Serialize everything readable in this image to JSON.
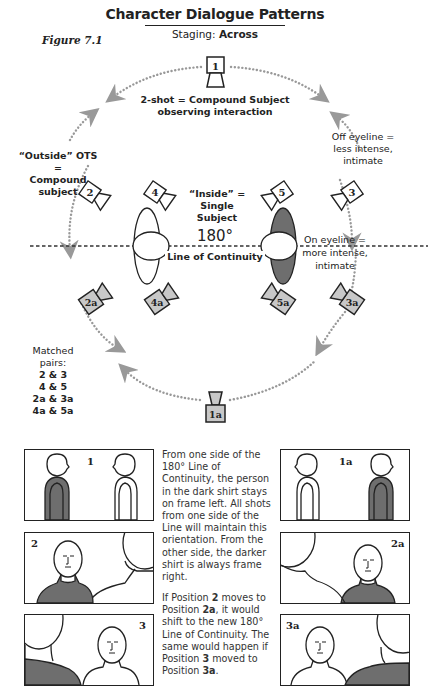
{
  "header": {
    "title": "Character Dialogue Patterns",
    "staging_label": "Staging:",
    "staging_value": "Across",
    "figure_label": "Figure 7.1"
  },
  "diagram": {
    "line_degrees": "180°",
    "line_label": "Line of Continuity",
    "annotations": {
      "two_shot": [
        "2-shot = Compound Subject",
        "observing interaction"
      ],
      "outside_ots": [
        "“Outside” OTS =",
        "Compound",
        "subject"
      ],
      "inside": [
        "“Inside” = Single",
        "Subject"
      ],
      "off_eyeline": [
        "Off eyeline =",
        "less intense,",
        "intimate"
      ],
      "on_eyeline": [
        "On eyeline =",
        "more intense,",
        "intimate"
      ]
    },
    "matched_pairs": {
      "heading": "Matched pairs:",
      "pairs": [
        "2 & 3",
        "4 & 5",
        "2a & 3a",
        "4a & 5a"
      ]
    },
    "cameras": [
      {
        "id": "1",
        "side": "top",
        "shaded": false
      },
      {
        "id": "2",
        "side": "upper-left",
        "shaded": false
      },
      {
        "id": "3",
        "side": "upper-right",
        "shaded": false
      },
      {
        "id": "4",
        "side": "inner-upper-left",
        "shaded": false
      },
      {
        "id": "5",
        "side": "inner-upper-right",
        "shaded": false
      },
      {
        "id": "2a",
        "side": "lower-left",
        "shaded": true
      },
      {
        "id": "3a",
        "side": "lower-right",
        "shaded": true
      },
      {
        "id": "4a",
        "side": "inner-lower-left",
        "shaded": true
      },
      {
        "id": "5a",
        "side": "inner-lower-right",
        "shaded": true
      },
      {
        "id": "1a",
        "side": "bottom",
        "shaded": true
      }
    ],
    "colors": {
      "arc": "#999999",
      "shade": "#6e6e6e",
      "camera_shade": "#c8c8c8"
    }
  },
  "frames": {
    "left": [
      {
        "label": "1"
      },
      {
        "label": "2"
      },
      {
        "label": "3"
      }
    ],
    "right": [
      {
        "label": "1a"
      },
      {
        "label": "2a"
      },
      {
        "label": "3a"
      }
    ]
  },
  "explanation": {
    "para1": "From one side of the 180° Line of Continuity, the person in the dark shirt stays on frame left. All shots from one side of the Line will maintain this orientation. From the other side, the darker shirt is always frame right.",
    "para2_parts": [
      "If Position ",
      "2",
      " moves to Position ",
      "2a",
      ", it would shift to the new 180° Line of Continuity. The same would happen if Position ",
      "3",
      " moved to Position ",
      "3a",
      "."
    ]
  }
}
